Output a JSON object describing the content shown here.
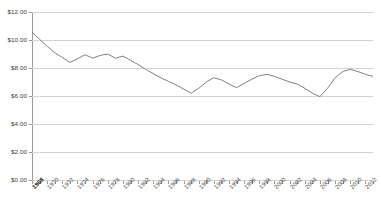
{
  "chart_data": {
    "type": "line",
    "title": "",
    "subtitle": "",
    "xlabel": "",
    "ylabel": "",
    "ylim": [
      0,
      12
    ],
    "xlim": [
      1968,
      2013
    ],
    "grid": "horizontal",
    "legend": "none",
    "y_tick_labels": [
      "$12.00",
      "$10.00",
      "$8.00",
      "$6.00",
      "$4.00",
      "$2.00",
      "$0.00"
    ],
    "y_tick_values": [
      12,
      10,
      8,
      6,
      4,
      2,
      0
    ],
    "y_tick_step": 2,
    "x_tick_labels": [
      "1968",
      "1970",
      "1972",
      "1974",
      "1976",
      "1978",
      "1980",
      "1982",
      "1984",
      "1986",
      "1988",
      "1990",
      "1992",
      "1994",
      "1996",
      "1998",
      "2000",
      "2002",
      "2004",
      "2006",
      "2008",
      "2010",
      "2012"
    ],
    "x_tick_label_rotation": -45,
    "x_first_label_emphasized": true,
    "series": [
      {
        "name": "value",
        "color": "#808080",
        "x": [
          1968,
          1969,
          1970,
          1971,
          1972,
          1973,
          1974,
          1975,
          1976,
          1977,
          1978,
          1979,
          1980,
          1981,
          1982,
          1983,
          1984,
          1985,
          1986,
          1987,
          1988,
          1989,
          1990,
          1991,
          1992,
          1993,
          1994,
          1995,
          1996,
          1997,
          1998,
          1999,
          2000,
          2001,
          2002,
          2003,
          2004,
          2005,
          2006,
          2007,
          2008,
          2009,
          2010,
          2011,
          2012,
          2013
        ],
        "values": [
          10.55,
          10.05,
          9.55,
          9.1,
          8.75,
          8.4,
          8.65,
          8.95,
          8.7,
          8.9,
          9.0,
          8.7,
          8.85,
          8.55,
          8.25,
          7.9,
          7.6,
          7.3,
          7.05,
          6.8,
          6.5,
          6.2,
          6.55,
          7.0,
          7.3,
          7.15,
          6.85,
          6.6,
          6.9,
          7.2,
          7.45,
          7.55,
          7.4,
          7.2,
          7.0,
          6.85,
          6.55,
          6.2,
          5.95,
          6.55,
          7.3,
          7.75,
          7.9,
          7.75,
          7.55,
          7.4
        ]
      }
    ]
  }
}
